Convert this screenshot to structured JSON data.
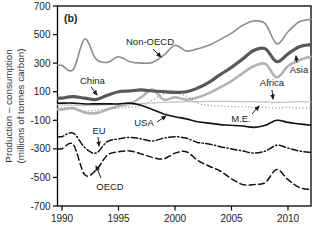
{
  "chart_data": {
    "type": "line",
    "panel_label": "(b)",
    "title": "",
    "xlabel": "",
    "ylabel_line1": "Production – consumption",
    "ylabel_line2": "(millions of tonnes carbon)",
    "x_range": [
      1990,
      2012
    ],
    "ylim": [
      -700,
      700
    ],
    "x_ticks": [
      1990,
      1995,
      2000,
      2005,
      2010
    ],
    "y_ticks": [
      700,
      500,
      300,
      100,
      -100,
      -300,
      -500,
      -700
    ],
    "grid": false,
    "legend_position": "inline-annotations",
    "axis_color": "#000000",
    "x": [
      1990,
      1991,
      1992,
      1993,
      1994,
      1995,
      1996,
      1997,
      1998,
      1999,
      2000,
      2001,
      2002,
      2003,
      2004,
      2005,
      2006,
      2007,
      2008,
      2009,
      2010,
      2011,
      2012
    ],
    "series": [
      {
        "name": "Asia",
        "color": "#b3b3b3",
        "width": 2.6,
        "dash": "solid",
        "values": [
          -25,
          -15,
          -45,
          -50,
          -25,
          0,
          15,
          60,
          115,
          45,
          60,
          45,
          60,
          90,
          130,
          175,
          230,
          280,
          295,
          200,
          280,
          320,
          345
        ]
      },
      {
        "name": "Africa",
        "color": "#c6c6c6",
        "width": 1.3,
        "dash": "solid",
        "values": [
          8,
          5,
          3,
          6,
          10,
          12,
          15,
          18,
          22,
          26,
          28,
          30,
          30,
          32,
          33,
          32,
          30,
          30,
          28,
          25,
          27,
          30,
          27
        ]
      },
      {
        "name": "Non-OECD",
        "color": "#8c8c8c",
        "width": 1.6,
        "dash": "solid",
        "values": [
          285,
          255,
          470,
          330,
          305,
          345,
          310,
          300,
          305,
          355,
          425,
          385,
          400,
          425,
          465,
          510,
          565,
          595,
          575,
          435,
          520,
          590,
          605
        ]
      },
      {
        "name": "M.E.",
        "color": "#999999",
        "width": 1.3,
        "dash": "dotted",
        "values": [
          -10,
          -20,
          -35,
          -30,
          -20,
          -15,
          -8,
          0,
          40,
          85,
          90,
          70,
          20,
          5,
          0,
          -5,
          -5,
          -10,
          -10,
          -15,
          -10,
          -15,
          -15
        ]
      },
      {
        "name": "China",
        "color": "#595959",
        "width": 3.2,
        "dash": "solid",
        "values": [
          55,
          65,
          55,
          45,
          75,
          100,
          105,
          113,
          105,
          100,
          95,
          100,
          125,
          165,
          220,
          270,
          330,
          390,
          400,
          310,
          365,
          415,
          430
        ]
      },
      {
        "name": "USA",
        "color": "#111111",
        "width": 1.6,
        "dash": "solid",
        "values": [
          20,
          20,
          15,
          15,
          15,
          15,
          20,
          5,
          -25,
          -55,
          -75,
          -90,
          -110,
          -120,
          -130,
          -135,
          -140,
          -150,
          -135,
          -100,
          -115,
          -125,
          -135
        ]
      },
      {
        "name": "EU",
        "color": "#111111",
        "width": 1.5,
        "dash": "dashdot",
        "values": [
          -215,
          -190,
          -290,
          -330,
          -250,
          -230,
          -220,
          -230,
          -245,
          -225,
          -215,
          -225,
          -255,
          -265,
          -285,
          -300,
          -315,
          -330,
          -315,
          -275,
          -295,
          -315,
          -325
        ]
      },
      {
        "name": "OECD",
        "color": "#111111",
        "width": 1.5,
        "dash": "dashed",
        "values": [
          -300,
          -270,
          -480,
          -450,
          -345,
          -320,
          -315,
          -335,
          -360,
          -370,
          -330,
          -320,
          -380,
          -420,
          -455,
          -510,
          -550,
          -550,
          -535,
          -445,
          -515,
          -570,
          -585
        ]
      }
    ],
    "annotations": [
      {
        "text": "Non-OECD",
        "tx": 126,
        "ty": 45,
        "anchor": "start",
        "arrow": {
          "x1": 153,
          "y1": 49,
          "x2": 161,
          "y2": 57
        }
      },
      {
        "text": "China",
        "tx": 80,
        "ty": 84,
        "anchor": "start",
        "arrow": {
          "x1": 91,
          "y1": 87,
          "x2": 97,
          "y2": 95
        }
      },
      {
        "text": "Asia",
        "tx": 299,
        "ty": 73,
        "anchor": "middle",
        "arrow": {
          "x1": 297,
          "y1": 63,
          "x2": 296,
          "y2": 56
        }
      },
      {
        "text": "Africa",
        "tx": 272,
        "ty": 86,
        "anchor": "middle",
        "arrow": {
          "x1": 272,
          "y1": 90,
          "x2": 273,
          "y2": 99
        }
      },
      {
        "text": "M.E.",
        "tx": 241,
        "ty": 122,
        "anchor": "middle",
        "arrow": {
          "x1": 252,
          "y1": 114,
          "x2": 259,
          "y2": 106
        }
      },
      {
        "text": "USA",
        "tx": 144,
        "ty": 126,
        "anchor": "middle",
        "arrow": {
          "x1": 157,
          "y1": 122,
          "x2": 166,
          "y2": 116
        }
      },
      {
        "text": "EU",
        "tx": 99,
        "ty": 134,
        "anchor": "middle",
        "arrow": {
          "x1": 98,
          "y1": 137,
          "x2": 99,
          "y2": 146
        }
      },
      {
        "text": "OECD",
        "tx": 110,
        "ty": 190,
        "anchor": "middle",
        "arrow": {
          "x1": 101,
          "y1": 178,
          "x2": 96,
          "y2": 166
        }
      }
    ]
  }
}
